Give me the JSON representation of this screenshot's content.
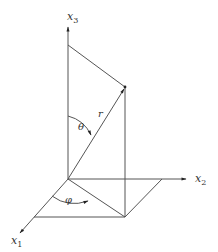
{
  "diagram": {
    "type": "spherical-coordinates",
    "colors": {
      "line": "#555555",
      "text": "#333333",
      "background": "#ffffff"
    },
    "axes": [
      {
        "id": "x1",
        "label": "x",
        "subscript": "1"
      },
      {
        "id": "x2",
        "label": "x",
        "subscript": "2"
      },
      {
        "id": "x3",
        "label": "x",
        "subscript": "3"
      }
    ],
    "labels": {
      "radius": "r",
      "polar_angle": "θ",
      "azimuth_angle": "φ"
    }
  }
}
